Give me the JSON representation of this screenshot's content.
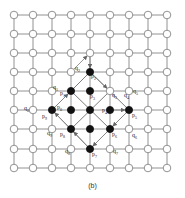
{
  "figure": {
    "caption": "(b)",
    "grid": {
      "columns": 9,
      "rows": 9,
      "x_positions": [
        14,
        33,
        52,
        71,
        90,
        110,
        129,
        148,
        167
      ],
      "y_positions": [
        15,
        34,
        53,
        72,
        91,
        110,
        129,
        149,
        168
      ],
      "line_color": "#777777",
      "node_fill": "#ffffff",
      "node_stroke": "#777777"
    },
    "active_nodes": [
      {
        "col": 4,
        "row": 3
      },
      {
        "col": 3,
        "row": 4
      },
      {
        "col": 4,
        "row": 4
      },
      {
        "col": 2,
        "row": 5
      },
      {
        "col": 3,
        "row": 5
      },
      {
        "col": 4,
        "row": 5
      },
      {
        "col": 5,
        "row": 5
      },
      {
        "col": 6,
        "row": 5
      },
      {
        "col": 3,
        "row": 6
      },
      {
        "col": 4,
        "row": 6
      },
      {
        "col": 5,
        "row": 6
      },
      {
        "col": 4,
        "row": 7
      }
    ],
    "active_fill": "#111111",
    "diagonal_lines": [
      [
        3,
        4,
        5,
        6
      ],
      [
        4,
        4,
        5,
        5
      ],
      [
        3,
        5,
        5,
        7
      ]
    ],
    "labels": [
      {
        "text": "p",
        "sub": "0",
        "x": 57,
        "y": 109
      },
      {
        "text": "p",
        "sub": "1",
        "x": 60,
        "y": 95
      },
      {
        "text": "p",
        "sub": "2",
        "x": 91,
        "y": 78
      },
      {
        "text": "p",
        "sub": "3",
        "x": 90,
        "y": 98
      },
      {
        "text": "p",
        "sub": "4",
        "x": 102,
        "y": 112
      },
      {
        "text": "p",
        "sub": "5",
        "x": 132,
        "y": 117
      },
      {
        "text": "p",
        "sub": "6",
        "x": 112,
        "y": 136
      },
      {
        "text": "p",
        "sub": "7",
        "x": 92,
        "y": 156
      },
      {
        "text": "p",
        "sub": "8",
        "x": 60,
        "y": 136
      },
      {
        "text": "p",
        "sub": "9",
        "x": 42,
        "y": 118
      },
      {
        "text": "q",
        "sub": "0",
        "x": 24,
        "y": 110
      },
      {
        "text": "q",
        "sub": "1",
        "x": 53,
        "y": 89
      },
      {
        "text": "q",
        "sub": "2",
        "x": 75,
        "y": 70
      },
      {
        "text": "q",
        "sub": "3",
        "x": 112,
        "y": 97
      },
      {
        "text": "q",
        "sub": "4",
        "x": 124,
        "y": 97
      },
      {
        "text": "q",
        "sub": "5",
        "x": 133,
        "y": 93
      },
      {
        "text": "q",
        "sub": "6",
        "x": 132,
        "y": 137
      },
      {
        "text": "q",
        "sub": "7",
        "x": 113,
        "y": 153
      },
      {
        "text": "q",
        "sub": "8",
        "x": 65,
        "y": 153
      },
      {
        "text": "q",
        "sub": "9",
        "x": 47,
        "y": 135
      }
    ],
    "arrows": [
      {
        "from": [
          52,
          110
        ],
        "to": [
          71,
          91
        ]
      },
      {
        "from": [
          71,
          72
        ],
        "to": [
          90,
          53
        ]
      },
      {
        "from": [
          90,
          53
        ],
        "to": [
          90,
          72
        ]
      },
      {
        "from": [
          90,
          72
        ],
        "to": [
          110,
          91
        ]
      },
      {
        "from": [
          110,
          110
        ],
        "to": [
          129,
          110
        ]
      },
      {
        "from": [
          129,
          110
        ],
        "to": [
          110,
          129
        ]
      },
      {
        "from": [
          110,
          129
        ],
        "to": [
          90,
          149
        ]
      },
      {
        "from": [
          90,
          149
        ],
        "to": [
          71,
          129
        ]
      },
      {
        "from": [
          71,
          129
        ],
        "to": [
          52,
          110
        ]
      }
    ]
  }
}
